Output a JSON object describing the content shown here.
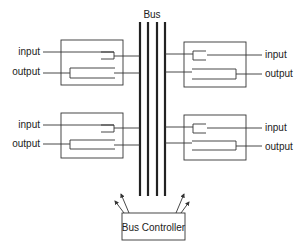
{
  "diagram": {
    "bus_label": "Bus",
    "controller_label": "Bus Controller",
    "modules": [
      {
        "id": "top-left",
        "input_label": "input",
        "output_label": "output"
      },
      {
        "id": "top-right",
        "input_label": "input",
        "output_label": "output"
      },
      {
        "id": "bottom-left",
        "input_label": "input",
        "output_label": "output"
      },
      {
        "id": "bottom-right",
        "input_label": "input",
        "output_label": "output"
      }
    ],
    "bus_line_count": 4
  }
}
